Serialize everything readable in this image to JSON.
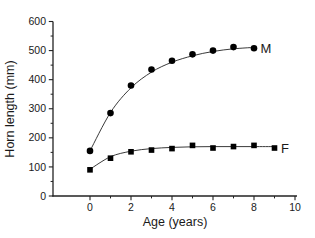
{
  "chart_data": {
    "type": "scatter",
    "title": "",
    "xlabel": "Age (years)",
    "ylabel": "Horn length (mm)",
    "xlim": [
      0,
      10
    ],
    "ylim": [
      0,
      600
    ],
    "x_major_ticks": [
      0,
      2,
      4,
      6,
      8,
      10
    ],
    "x_minor_ticks": [
      1,
      3,
      5,
      7,
      9
    ],
    "y_major_ticks": [
      0,
      100,
      200,
      300,
      400,
      500,
      600
    ],
    "y_minor_ticks": [
      50,
      150,
      250,
      350,
      450,
      550
    ],
    "grid": false,
    "legend_position": "inline-end-labels",
    "axis_color": "#222222",
    "curve_color": "#3a3a3a",
    "series": [
      {
        "name": "males",
        "label": "M",
        "marker": "circle",
        "color": "#000000",
        "x": [
          0,
          1,
          2,
          3,
          4,
          5,
          6,
          7,
          8
        ],
        "y": [
          155,
          285,
          380,
          435,
          465,
          487,
          500,
          512,
          508
        ],
        "fitted_curve_y": [
          155,
          287,
          372,
          426,
          460,
          482,
          497,
          506,
          511
        ]
      },
      {
        "name": "females",
        "label": "F",
        "marker": "square",
        "color": "#000000",
        "x": [
          0,
          1,
          2,
          3,
          4,
          5,
          6,
          7,
          8,
          9
        ],
        "y": [
          90,
          130,
          152,
          158,
          163,
          174,
          165,
          170,
          174,
          165
        ],
        "fitted_curve_y": [
          92,
          135,
          154,
          163,
          167,
          169,
          170,
          170,
          170,
          170
        ]
      }
    ]
  }
}
